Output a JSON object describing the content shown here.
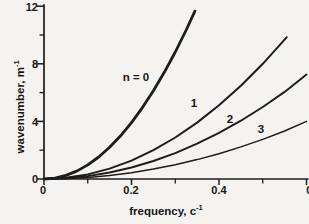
{
  "chart_data": {
    "type": "line",
    "title": "",
    "xlabel": "frequency, c⁻¹",
    "ylabel": "wavenumber, m⁻¹",
    "xlabel_parts": {
      "base": "frequency, c",
      "sup": "-1"
    },
    "ylabel_parts": {
      "base": "wavenumber, m",
      "sup": "-1"
    },
    "xlim": [
      0,
      0.6
    ],
    "ylim": [
      0,
      12
    ],
    "grid": "off",
    "legend": "none",
    "ink": "#1c1c1c",
    "background": "#f4f3f0",
    "xticks": [
      {
        "value": 0,
        "label": "0"
      },
      {
        "value": 0.2,
        "label": "0.2"
      },
      {
        "value": 0.4,
        "label": "0.4"
      },
      {
        "value": 0.6,
        "label": "0.6"
      }
    ],
    "xminor": [
      0.1,
      0.3,
      0.5
    ],
    "yticks": [
      {
        "value": 0,
        "label": "0"
      },
      {
        "value": 4,
        "label": "4"
      },
      {
        "value": 8,
        "label": "8"
      },
      {
        "value": 12,
        "label": "12"
      }
    ],
    "yminor": [
      2,
      6,
      10
    ],
    "series": [
      {
        "id": "n0",
        "name": "n = 0",
        "width": 2.8,
        "points": [
          [
            0,
            0
          ],
          [
            0.025,
            0.06
          ],
          [
            0.05,
            0.25
          ],
          [
            0.075,
            0.55
          ],
          [
            0.1,
            0.98
          ],
          [
            0.125,
            1.53
          ],
          [
            0.15,
            2.21
          ],
          [
            0.175,
            3.0
          ],
          [
            0.2,
            3.92
          ],
          [
            0.225,
            4.96
          ],
          [
            0.25,
            6.13
          ],
          [
            0.275,
            7.41
          ],
          [
            0.3,
            8.82
          ],
          [
            0.325,
            10.35
          ],
          [
            0.345,
            11.66
          ]
        ]
      },
      {
        "id": "n1",
        "name": "n = 1",
        "width": 2.0,
        "points": [
          [
            0,
            0
          ],
          [
            0.05,
            0.08
          ],
          [
            0.1,
            0.32
          ],
          [
            0.15,
            0.72
          ],
          [
            0.2,
            1.28
          ],
          [
            0.25,
            2.0
          ],
          [
            0.3,
            2.88
          ],
          [
            0.35,
            3.92
          ],
          [
            0.4,
            5.12
          ],
          [
            0.45,
            6.48
          ],
          [
            0.5,
            8.0
          ],
          [
            0.555,
            9.85
          ]
        ]
      },
      {
        "id": "n2",
        "name": "n = 2",
        "width": 1.9,
        "points": [
          [
            0,
            0
          ],
          [
            0.05,
            0.05
          ],
          [
            0.1,
            0.2
          ],
          [
            0.15,
            0.45
          ],
          [
            0.2,
            0.8
          ],
          [
            0.25,
            1.25
          ],
          [
            0.3,
            1.8
          ],
          [
            0.35,
            2.45
          ],
          [
            0.4,
            3.2
          ],
          [
            0.45,
            4.05
          ],
          [
            0.5,
            5.0
          ],
          [
            0.55,
            6.05
          ],
          [
            0.6,
            7.25
          ]
        ]
      },
      {
        "id": "n3",
        "name": "n = 3",
        "width": 1.5,
        "points": [
          [
            0,
            0
          ],
          [
            0.05,
            0.03
          ],
          [
            0.1,
            0.11
          ],
          [
            0.15,
            0.25
          ],
          [
            0.2,
            0.44
          ],
          [
            0.25,
            0.69
          ],
          [
            0.3,
            0.99
          ],
          [
            0.35,
            1.35
          ],
          [
            0.4,
            1.76
          ],
          [
            0.45,
            2.23
          ],
          [
            0.5,
            2.75
          ],
          [
            0.55,
            3.33
          ],
          [
            0.6,
            4.0
          ]
        ]
      }
    ],
    "annotations": [
      {
        "text": "n = 0",
        "x": 0.21,
        "y": 7.1
      },
      {
        "text": "1",
        "x": 0.34,
        "y": 5.3
      },
      {
        "text": "2",
        "x": 0.43,
        "y": 4.2
      },
      {
        "text": "3",
        "x": 0.5,
        "y": 3.5
      }
    ]
  }
}
